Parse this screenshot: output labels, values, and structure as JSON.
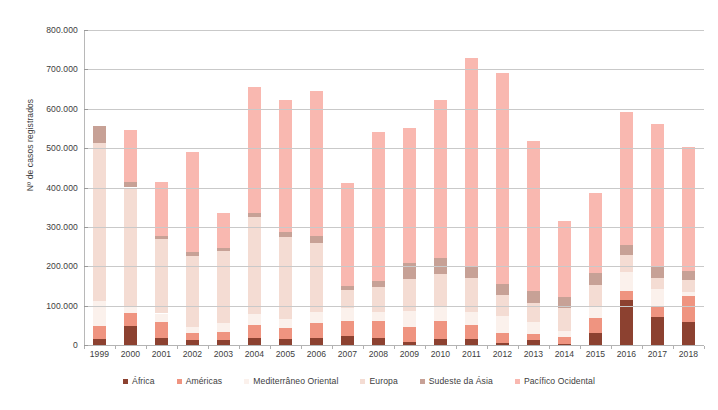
{
  "chart_data": {
    "type": "bar",
    "subtype": "stacked",
    "title": "",
    "xlabel": "",
    "ylabel": "Nº de casos registrados",
    "ylim": [
      0,
      800000
    ],
    "ytick_step": 100000,
    "ytick_labels": [
      "800.000",
      "700.000",
      "600.000",
      "500.000",
      "400.000",
      "300.000",
      "200.000",
      "100.000",
      "0"
    ],
    "ytick_values": [
      800000,
      700000,
      600000,
      500000,
      400000,
      300000,
      200000,
      100000,
      0
    ],
    "grid": true,
    "legend_position": "bottom",
    "categories": [
      "1999",
      "2000",
      "2001",
      "2002",
      "2003",
      "2004",
      "2005",
      "2006",
      "2007",
      "2008",
      "2009",
      "2010",
      "2011",
      "2012",
      "2013",
      "2014",
      "2015",
      "2016",
      "2017",
      "2018"
    ],
    "series": [
      {
        "name": "África",
        "color": "#8c4130",
        "values": [
          14000,
          48000,
          18000,
          13000,
          12000,
          17000,
          15000,
          18000,
          22000,
          17000,
          8000,
          15000,
          14000,
          4000,
          12000,
          3000,
          30000,
          115000,
          70000,
          58000
        ]
      },
      {
        "name": "Américas",
        "color": "#ef9480",
        "values": [
          34000,
          33000,
          40000,
          17000,
          21000,
          35000,
          29000,
          37000,
          39000,
          45000,
          37000,
          45000,
          38000,
          26000,
          16000,
          17000,
          38000,
          21000,
          28000,
          67000
        ]
      },
      {
        "name": "Mediterrâneo Oriental",
        "color": "#fbf1ec",
        "values": [
          63000,
          18000,
          22000,
          15000,
          23000,
          26000,
          21000,
          30000,
          34000,
          23000,
          41000,
          36000,
          33000,
          44000,
          30000,
          16000,
          32000,
          49000,
          44000,
          10000
        ]
      },
      {
        "name": "Europa",
        "color": "#f4dcd3",
        "values": [
          401000,
          301000,
          188000,
          181000,
          183000,
          246000,
          209000,
          175000,
          44000,
          63000,
          81000,
          84000,
          86000,
          52000,
          48000,
          58000,
          53000,
          43000,
          27000,
          29000
        ]
      },
      {
        "name": "Sudeste da Ásia",
        "color": "#c7a196",
        "values": [
          45000,
          14000,
          10000,
          10000,
          8000,
          12000,
          13000,
          17000,
          11000,
          14000,
          40000,
          40000,
          29000,
          29000,
          32000,
          27000,
          31000,
          25000,
          32000,
          24000
        ]
      },
      {
        "name": "Pacífico Ocidental",
        "color": "#f9b8b0",
        "values": [
          0,
          132000,
          136000,
          253000,
          88000,
          320000,
          334000,
          367000,
          262000,
          380000,
          345000,
          402000,
          530000,
          537000,
          381000,
          193000,
          201000,
          340000,
          361000,
          315000
        ]
      }
    ],
    "totals": [
      557000,
      546000,
      414000,
      489000,
      335000,
      656000,
      621000,
      644000,
      412000,
      542000,
      552000,
      622000,
      730000,
      692000,
      519000,
      314000,
      385000,
      593000,
      562000,
      503000
    ]
  },
  "legend": {
    "items": [
      {
        "label": "África",
        "color": "#8c4130"
      },
      {
        "label": "Américas",
        "color": "#ef9480"
      },
      {
        "label": "Mediterrâneo Oriental",
        "color": "#fbf1ec"
      },
      {
        "label": "Europa",
        "color": "#f4dcd3"
      },
      {
        "label": "Sudeste da Ásia",
        "color": "#c7a196"
      },
      {
        "label": "Pacífico Ocidental",
        "color": "#f9b8b0"
      }
    ]
  },
  "axes": {
    "y_title": "Nº de casos registrados"
  }
}
